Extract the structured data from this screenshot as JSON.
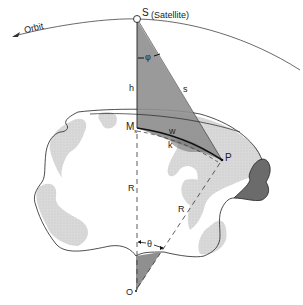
{
  "diagram": {
    "type": "satellite-earth-geometry",
    "labels": {
      "orbit": "Orbit",
      "satellite_point": "S",
      "satellite_desc": "(Satellite)",
      "altitude": "h",
      "slant_range": "s",
      "nadir_angle": "φ",
      "subsatellite_point": "M",
      "subsatellite_subscript": "s",
      "arc_chord": "w",
      "arc_surface": "k",
      "ground_point": "P",
      "radius_vertical": "R",
      "radius_slanted": "R",
      "central_angle": "θ",
      "earth_center": "O"
    },
    "colors": {
      "line": "#222222",
      "triangle_fill": "#8f8f8f",
      "land_light": "#d6d6d6",
      "land_dark": "#6b6b6b",
      "background": "#ffffff"
    }
  }
}
